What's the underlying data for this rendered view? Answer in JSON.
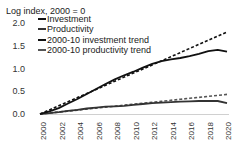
{
  "chart_data": {
    "type": "line",
    "title": "",
    "ylabel": "Log index, 2000 = 0",
    "xlabel": "",
    "ylim": [
      0,
      2.0
    ],
    "xlim": [
      2000,
      2020
    ],
    "yticks": [
      "0.0",
      "0.5",
      "1.0",
      "1.5",
      "2.0"
    ],
    "xticks": [
      "2000",
      "2002",
      "2004",
      "2006",
      "2008",
      "2010",
      "2012",
      "2014",
      "2016",
      "2018",
      "2020"
    ],
    "grid": false,
    "legend_position": "top-left",
    "x": [
      2000,
      2001,
      2002,
      2003,
      2004,
      2005,
      2006,
      2007,
      2008,
      2009,
      2010,
      2011,
      2012,
      2013,
      2014,
      2015,
      2016,
      2017,
      2018,
      2019,
      2020
    ],
    "series": [
      {
        "name": "Investment",
        "style": "solid",
        "color": "#111111",
        "values": [
          0.0,
          0.06,
          0.13,
          0.23,
          0.33,
          0.44,
          0.55,
          0.66,
          0.76,
          0.85,
          0.93,
          1.02,
          1.1,
          1.16,
          1.2,
          1.23,
          1.27,
          1.32,
          1.38,
          1.41,
          1.37
        ]
      },
      {
        "name": "Productivity",
        "style": "solid",
        "color": "#333333",
        "values": [
          0.0,
          0.02,
          0.04,
          0.07,
          0.09,
          0.12,
          0.14,
          0.16,
          0.17,
          0.18,
          0.2,
          0.22,
          0.24,
          0.25,
          0.26,
          0.27,
          0.28,
          0.285,
          0.29,
          0.285,
          0.24
        ]
      },
      {
        "name": "2000-10 investment trend",
        "style": "dashed",
        "color": "#111111",
        "values": [
          0.0,
          0.09,
          0.18,
          0.27,
          0.36,
          0.45,
          0.54,
          0.63,
          0.72,
          0.81,
          0.9,
          0.99,
          1.08,
          1.17,
          1.26,
          1.35,
          1.44,
          1.53,
          1.62,
          1.71,
          1.8
        ]
      },
      {
        "name": "2000-10 productivity trend",
        "style": "dashed",
        "color": "#555555",
        "values": [
          0.0,
          0.0215,
          0.043,
          0.0645,
          0.086,
          0.1075,
          0.129,
          0.1505,
          0.172,
          0.1935,
          0.215,
          0.2365,
          0.258,
          0.2795,
          0.301,
          0.3225,
          0.344,
          0.3655,
          0.387,
          0.4085,
          0.43
        ]
      }
    ]
  },
  "legend": {
    "items": [
      {
        "label": "Investment"
      },
      {
        "label": "Productivity"
      },
      {
        "label": "2000-10 investment trend"
      },
      {
        "label": "2000-10 productivity trend"
      }
    ]
  },
  "axis": {
    "y_title": "Log index, 2000 = 0"
  }
}
